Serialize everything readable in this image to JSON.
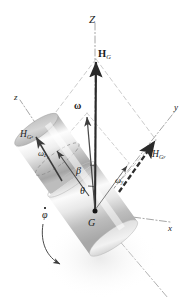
{
  "figure": {
    "background_color": "#ffffff",
    "ink_color": "#1b1b1b",
    "axis_color": "#8a8a8a",
    "construction_color": "#b4b4b4",
    "body_color_light": "#fdfdfd",
    "body_color_mid": "#c9c9c9",
    "body_color_dark": "#9a9a9a"
  },
  "axes": [
    {
      "id": "Z",
      "label": "Z",
      "style": "dash-dot",
      "note": "vertical fixed precession axis"
    },
    {
      "id": "z",
      "label": "z",
      "style": "dash-dot",
      "note": "body spin axis toward upper-left"
    },
    {
      "id": "y",
      "label": "y",
      "style": "dash-dot",
      "note": "transverse axis toward upper-right"
    },
    {
      "id": "x",
      "label": "x",
      "style": "dash-dot",
      "note": "transverse axis toward lower-right"
    }
  ],
  "vectors": [
    {
      "id": "HG",
      "label": "H",
      "sub": "G",
      "bold": true,
      "style": "solid-heavy",
      "note": "total angular momentum, along Z"
    },
    {
      "id": "HGz",
      "label": "H",
      "sub": "G",
      "sub2": "z",
      "bold": false,
      "style": "solid",
      "note": "component of H_G along z"
    },
    {
      "id": "HGy",
      "label": "H",
      "sub": "G",
      "sub2": "y",
      "bold": false,
      "style": "dashed-heavy",
      "note": "component of H_G along y"
    },
    {
      "id": "omega",
      "label": "ω",
      "bold": true,
      "style": "solid",
      "note": "total angular velocity"
    },
    {
      "id": "omegaz",
      "label": "ω",
      "sub2": "z",
      "bold": false,
      "style": "solid",
      "note": "spin component along z"
    },
    {
      "id": "omegay",
      "label": "ω",
      "sub2": "y",
      "bold": false,
      "style": "solid",
      "note": "transverse component along y"
    }
  ],
  "labels": {
    "Z": "Z",
    "z": "z",
    "y": "y",
    "x": "x",
    "HG": "H",
    "HG_sub": "G",
    "HGz": "H",
    "HGz_sub": "G",
    "HGz_sub2": "z",
    "HGy": "H",
    "HGy_sub": "G",
    "HGy_sub2": "y",
    "omega": "ω",
    "omegaz": "ω",
    "omegaz_sub": "z",
    "omegay": "ω",
    "omegay_sub": "y",
    "beta": "β",
    "theta": "θ",
    "G": "G",
    "phidot": "φ"
  },
  "angles": [
    {
      "id": "beta",
      "symbol": "β",
      "note": "angle between omega and z axis"
    },
    {
      "id": "theta",
      "symbol": "θ",
      "note": "angle between Z (H_G) and z axis"
    }
  ],
  "points": [
    {
      "id": "G",
      "label": "G",
      "note": "mass center, origin of body axes"
    }
  ],
  "motion": [
    {
      "id": "phidot",
      "symbol": "φ",
      "accent": "dot",
      "note": "precession rate about Z, curved arrow at lower-left of body"
    }
  ]
}
